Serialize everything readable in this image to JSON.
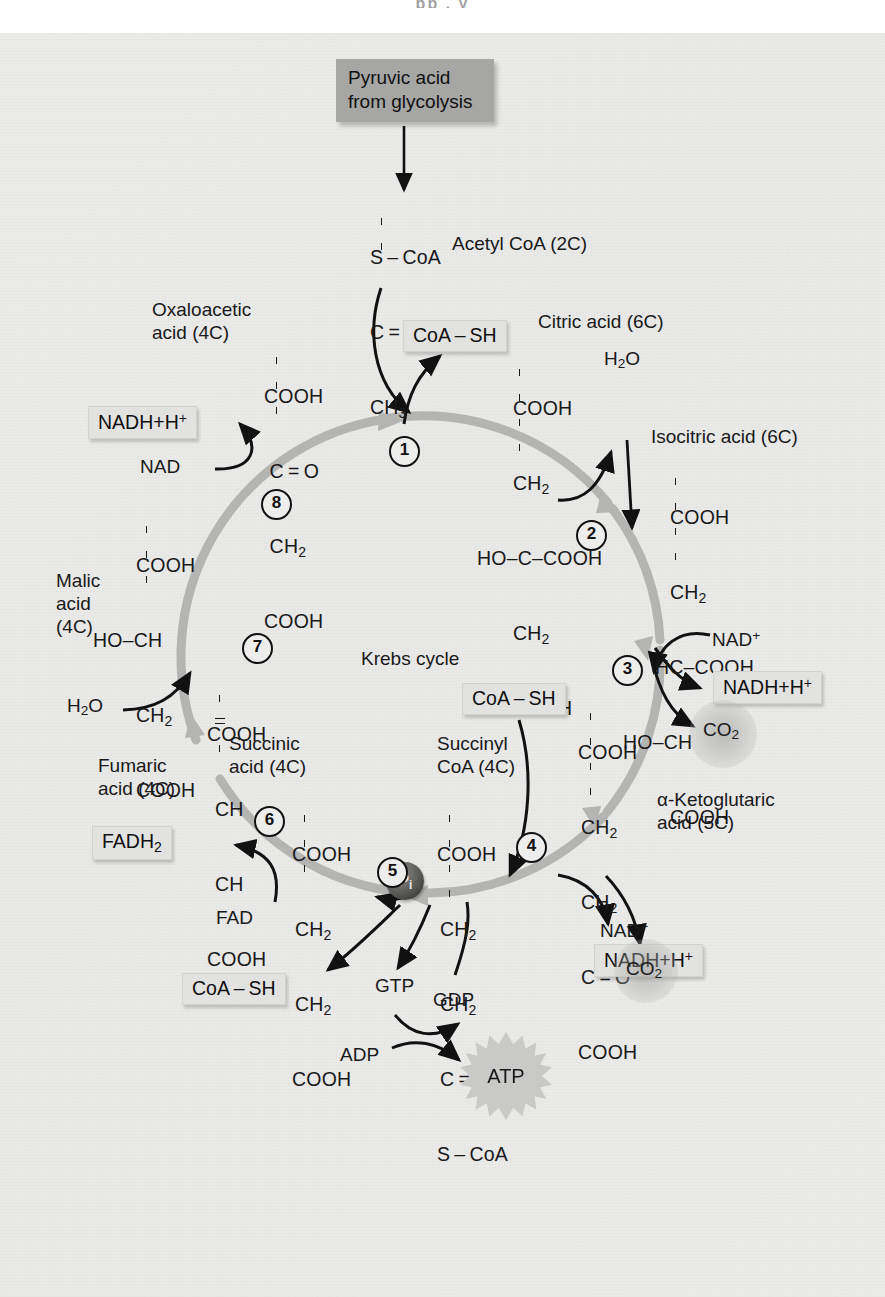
{
  "page": {
    "title": "Krebs cycle",
    "top_remnant": "pp          ,                   y"
  },
  "colors": {
    "paper": "#ebebea",
    "ring": "#b4b4b3",
    "text": "#19191a",
    "product_box": "#e2e2e1",
    "source_box": "#a6a6a5",
    "atp_burst": "#c9c9c8",
    "pi_sphere": "#4a4a49"
  },
  "source": {
    "line1": "Pyruvic acid",
    "line2": "from glycolysis"
  },
  "center_label": "Krebs cycle",
  "acetyl": {
    "name": "Acetyl CoA (2C)",
    "rows": [
      "S – CoA",
      "C = O",
      "CH3"
    ]
  },
  "metabolites": [
    {
      "id": "oxaloacetic",
      "name_line1": "Oxaloacetic",
      "name_line2": "acid (4C)",
      "rows": [
        "COOH",
        "C = O",
        "CH2",
        "COOH"
      ]
    },
    {
      "id": "citric",
      "name_line1": "Citric acid (6C)",
      "name_line2": "",
      "rows": [
        "COOH",
        "CH2",
        "HO–C–COOH",
        "CH2",
        "COOH"
      ]
    },
    {
      "id": "isocitric",
      "name_line1": "Isocitric acid (6C)",
      "name_line2": "",
      "rows": [
        "COOH",
        "CH2",
        "HC–COOH",
        "HO–CH",
        "COOH"
      ]
    },
    {
      "id": "alpha-ketoglutaric",
      "name_line1": "α-Ketoglutaric",
      "name_line2": "acid (5C)",
      "rows": [
        "COOH",
        "CH2",
        "CH2",
        "C = O",
        "COOH"
      ]
    },
    {
      "id": "succinyl-coa",
      "name_line1": "Succinyl",
      "name_line2": "CoA (4C)",
      "rows": [
        "COOH",
        "CH2",
        "CH2",
        "C = O",
        "S – CoA"
      ]
    },
    {
      "id": "succinic",
      "name_line1": "Succinic",
      "name_line2": "acid (4C)",
      "rows": [
        "COOH",
        "CH2",
        "CH2",
        "COOH"
      ]
    },
    {
      "id": "fumaric",
      "name_line1": "Fumaric",
      "name_line2": "acid (4C)",
      "rows": [
        "COOH",
        "CH",
        "CH",
        "COOH"
      ]
    },
    {
      "id": "malic",
      "name_line1": "Malic",
      "name_line2": "acid",
      "name_line3": "(4C)",
      "rows": [
        "COOH",
        "HO–CH",
        "CH2",
        "COOH"
      ]
    }
  ],
  "steps": [
    {
      "n": "1"
    },
    {
      "n": "2"
    },
    {
      "n": "3"
    },
    {
      "n": "4"
    },
    {
      "n": "5"
    },
    {
      "n": "6"
    },
    {
      "n": "7"
    },
    {
      "n": "8"
    }
  ],
  "reactants": {
    "h2o_step2": "H2O",
    "h2o_step7": "H2O",
    "nad_step3": "NAD+",
    "nad_step4": "NAD+",
    "nad_step8": "NAD",
    "fad_step6": "FAD",
    "adp": "ADP",
    "gtp": "GTP",
    "gdp": "GDP",
    "pi": "Pi"
  },
  "products": {
    "coash_step1": "CoA – SH",
    "coash_step4": "CoA – SH",
    "coash_step5": "CoA – SH",
    "nadh_step3": "NADH+H+",
    "nadh_step4": "NADH+H+",
    "nadh_step8": "NADH+H+",
    "co2_step3": "CO2",
    "co2_step4": "CO2",
    "fadh2_step6": "FADH2",
    "atp": "ATP"
  }
}
